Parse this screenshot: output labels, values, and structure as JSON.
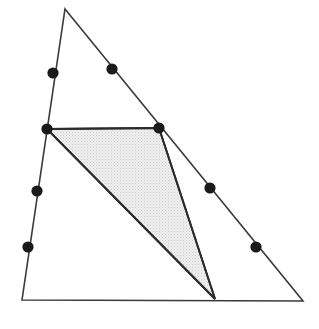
{
  "figure": {
    "canvas": {
      "width": 319,
      "height": 329,
      "background": "#ffffff"
    },
    "style": {
      "outline_color": "#3a3a3a",
      "outline_width": 1.6,
      "inner_outline_color": "#2b2b2b",
      "inner_outline_width": 1.8,
      "shade_fill": "#e9e9e9",
      "stipple_dot_color": "#c9c9c9",
      "point_color": "#1a1a1a",
      "point_radius": 5.6
    },
    "outer_triangle": {
      "name": "outer-triangle",
      "vertices": [
        {
          "label": "apex",
          "x": 65,
          "y": 9
        },
        {
          "label": "bottom-right",
          "x": 303,
          "y": 301
        },
        {
          "label": "bottom-left",
          "x": 22,
          "y": 300
        }
      ],
      "points_path": "65,9 303,301 22,300"
    },
    "shaded_triangle": {
      "name": "shaded-triangle",
      "vertices": [
        {
          "label": "upper-left",
          "x": 47,
          "y": 129
        },
        {
          "label": "upper-right",
          "x": 159,
          "y": 128
        },
        {
          "label": "lower",
          "x": 215,
          "y": 299
        }
      ],
      "points_path": "47,129 159,128 215,299"
    },
    "division_points": [
      {
        "name": "left-edge-point-1",
        "edge": "left",
        "x": 53,
        "y": 73
      },
      {
        "name": "left-edge-point-2",
        "edge": "left",
        "x": 47,
        "y": 129
      },
      {
        "name": "left-edge-point-3",
        "edge": "left",
        "x": 37,
        "y": 191
      },
      {
        "name": "left-edge-point-4",
        "edge": "left",
        "x": 28,
        "y": 247
      },
      {
        "name": "hypotenuse-point-1",
        "edge": "hypotenuse",
        "x": 112,
        "y": 69
      },
      {
        "name": "hypotenuse-point-2",
        "edge": "hypotenuse",
        "x": 159,
        "y": 128
      },
      {
        "name": "hypotenuse-point-3",
        "edge": "hypotenuse",
        "x": 210,
        "y": 188
      },
      {
        "name": "hypotenuse-point-4",
        "edge": "hypotenuse",
        "x": 256,
        "y": 247
      }
    ],
    "inner_segments": [
      {
        "name": "segment-top",
        "x1": 47,
        "y1": 129,
        "x2": 159,
        "y2": 128
      },
      {
        "name": "segment-left-diagonal",
        "x1": 47,
        "y1": 129,
        "x2": 215,
        "y2": 299
      },
      {
        "name": "segment-right-diagonal",
        "x1": 159,
        "y1": 128,
        "x2": 215,
        "y2": 299
      }
    ]
  }
}
